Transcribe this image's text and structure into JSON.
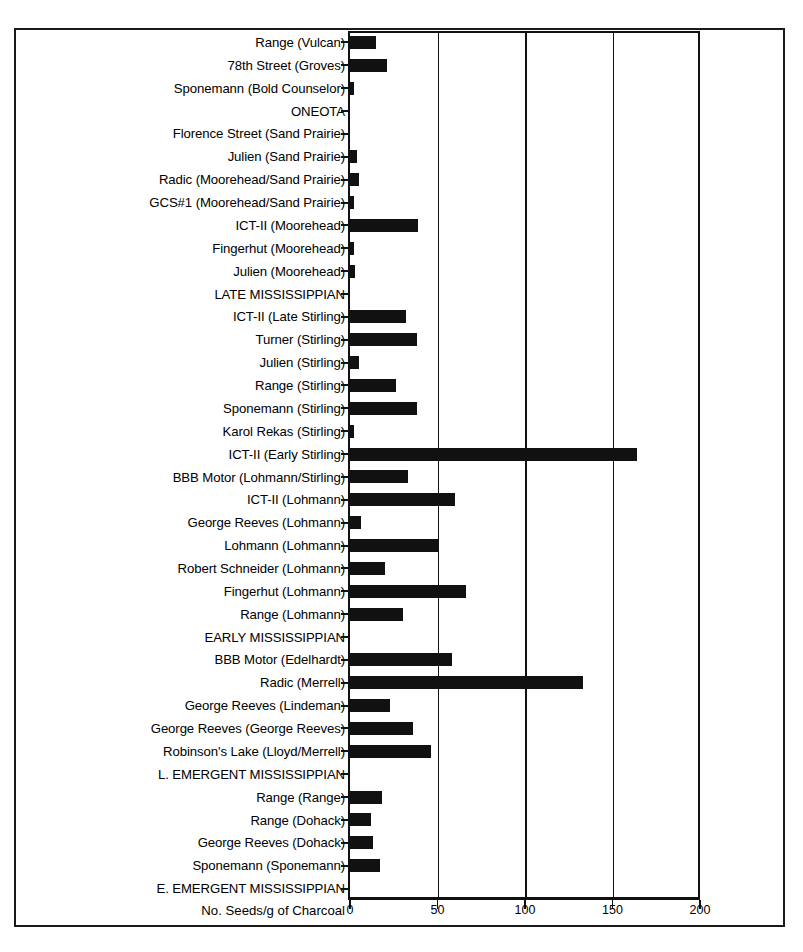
{
  "chart_data": {
    "type": "bar",
    "orientation": "horizontal",
    "title": "",
    "xlabel": "No. Seeds/g of Charcoal",
    "ylabel": "",
    "xlim": [
      0,
      200
    ],
    "xticks": [
      0,
      50,
      100,
      150,
      200
    ],
    "xtick_labels": [
      "0",
      "50",
      "100",
      "150",
      "200"
    ],
    "grid": true,
    "legend": "none",
    "categories": [
      "Range (Vulcan)",
      "78th Street (Groves)",
      "Sponemann (Bold Counselor)",
      "ONEOTA",
      "Florence Street (Sand Prairie)",
      "Julien (Sand Prairie)",
      "Radic (Moorehead/Sand Prairie)",
      "GCS#1 (Moorehead/Sand Prairie)",
      "ICT-II (Moorehead)",
      "Fingerhut (Moorehead)",
      "Julien (Moorehead)",
      "LATE MISSISSIPPIAN",
      "ICT-II (Late Stirling)",
      "Turner (Stirling)",
      "Julien (Stirling)",
      "Range (Stirling)",
      "Sponemann (Stirling)",
      "Karol Rekas (Stirling)",
      "ICT-II (Early Stirling)",
      "BBB Motor (Lohmann/Stirling)",
      "ICT-II (Lohmann)",
      "George Reeves (Lohmann)",
      "Lohmann (Lohmann)",
      "Robert Schneider (Lohmann)",
      "Fingerhut (Lohmann)",
      "Range (Lohmann)",
      "EARLY MISSISSIPPIAN",
      "BBB Motor (Edelhardt)",
      "Radic (Merrell)",
      "George Reeves (Lindeman)",
      "George Reeves (George Reeves)",
      "Robinson's Lake (Lloyd/Merrell)",
      "L. EMERGENT MISSISSIPPIAN",
      "Range (Range)",
      "Range (Dohack)",
      "George Reeves (Dohack)",
      "Sponemann (Sponemann)",
      "E. EMERGENT MISSISSIPPIAN"
    ],
    "values": [
      15,
      21,
      2,
      0,
      0,
      4,
      5,
      2,
      39,
      2,
      3,
      0,
      32,
      38,
      5,
      26,
      38,
      2,
      164,
      33,
      60,
      6,
      51,
      20,
      66,
      30,
      0,
      58,
      133,
      23,
      36,
      46,
      0,
      18,
      12,
      13,
      17,
      0
    ],
    "header_rows": [
      "ONEOTA",
      "LATE MISSISSIPPIAN",
      "EARLY MISSISSIPPIAN",
      "L. EMERGENT MISSISSIPPIAN",
      "E. EMERGENT MISSISSIPPIAN"
    ],
    "bar_color": "#111111",
    "axis_color": "#111111",
    "background_color": "#ffffff"
  }
}
